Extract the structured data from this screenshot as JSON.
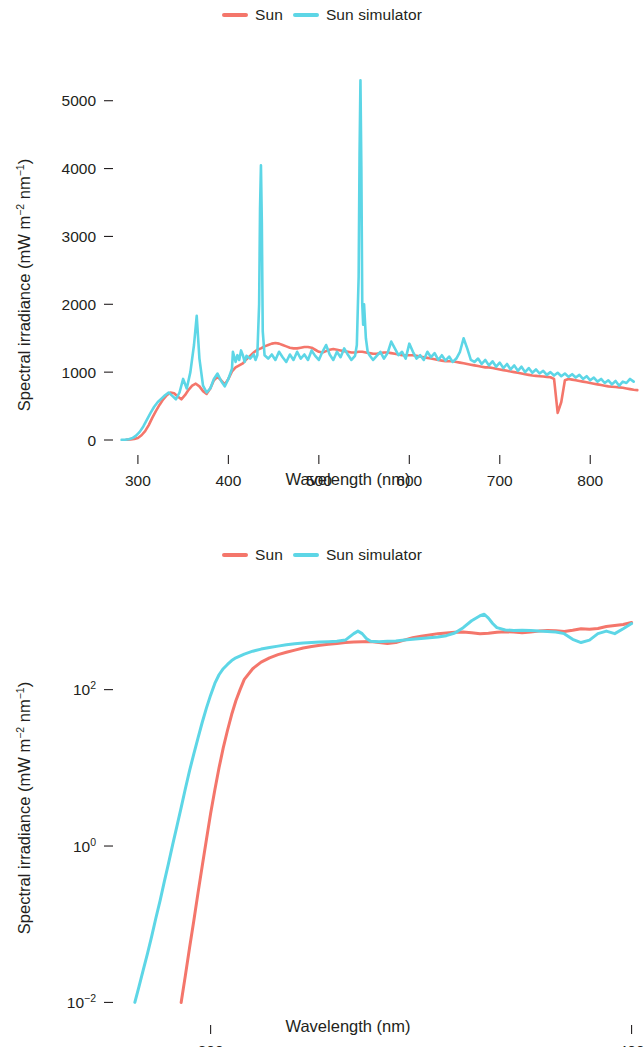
{
  "figures": [
    {
      "id": "linear-spectrum",
      "legend": [
        {
          "label": "Sun",
          "color": "#f4766b",
          "name": "sun"
        },
        {
          "label": "Sun simulator",
          "color": "#5dd6e6",
          "name": "sun-simulator"
        }
      ]
    },
    {
      "id": "log-spectrum",
      "legend": [
        {
          "label": "Sun",
          "color": "#f4766b",
          "name": "sun"
        },
        {
          "label": "Sun simulator",
          "color": "#5dd6e6",
          "name": "sun-simulator"
        }
      ]
    }
  ],
  "chart_data": [
    {
      "type": "line",
      "id": "linear-spectrum",
      "title": "",
      "xlabel": "Wavelength (nm)",
      "ylabel": "Spectral irradiance (mW m⁻² nm⁻¹)",
      "ylabel_parts": {
        "pre": "Spectral irradiance  (mW m",
        "sup1": "−2",
        "mid": " nm",
        "sup2": "−1",
        "post": ")"
      },
      "xlim": [
        278,
        855
      ],
      "ylim": [
        0,
        5600
      ],
      "yscale": "linear",
      "xticks": [
        300,
        400,
        500,
        600,
        700,
        800
      ],
      "xtick_labels": [
        "300",
        "400",
        "500",
        "600",
        "700",
        "800"
      ],
      "yticks": [
        0,
        1000,
        2000,
        3000,
        4000,
        5000
      ],
      "ytick_labels": [
        "0",
        "1000",
        "2000",
        "3000",
        "4000",
        "5000"
      ],
      "grid": false,
      "legend_position": "top-center",
      "annotations": [
        {
          "text": "Hg emission line",
          "x": 436,
          "y": 4050,
          "series": "Sun simulator"
        },
        {
          "text": "Hg emission line",
          "x": 546,
          "y": 5300,
          "series": "Sun simulator"
        },
        {
          "text": "O2 A-band absorption",
          "x": 760,
          "y": 400,
          "series": "Sun"
        }
      ],
      "series": [
        {
          "name": "Sun",
          "color": "#f4766b",
          "x": [
            288,
            292,
            296,
            300,
            304,
            308,
            312,
            316,
            320,
            324,
            328,
            332,
            336,
            340,
            344,
            348,
            352,
            356,
            360,
            364,
            368,
            372,
            376,
            380,
            384,
            388,
            392,
            396,
            400,
            404,
            408,
            412,
            416,
            420,
            424,
            428,
            432,
            436,
            440,
            444,
            448,
            452,
            456,
            460,
            464,
            468,
            472,
            476,
            480,
            484,
            488,
            492,
            496,
            500,
            504,
            508,
            512,
            516,
            520,
            524,
            528,
            532,
            536,
            540,
            544,
            548,
            552,
            556,
            560,
            564,
            568,
            572,
            576,
            580,
            584,
            588,
            592,
            596,
            600,
            604,
            608,
            612,
            616,
            620,
            624,
            628,
            632,
            636,
            640,
            644,
            648,
            652,
            656,
            660,
            664,
            668,
            672,
            676,
            680,
            684,
            688,
            692,
            696,
            700,
            704,
            708,
            712,
            716,
            720,
            724,
            728,
            732,
            736,
            740,
            744,
            748,
            752,
            756,
            760,
            764,
            768,
            772,
            776,
            780,
            784,
            788,
            792,
            796,
            800,
            804,
            808,
            812,
            816,
            820,
            824,
            828,
            832,
            836,
            840,
            844,
            848,
            852
          ],
          "y": [
            5,
            8,
            14,
            30,
            70,
            130,
            220,
            330,
            430,
            520,
            600,
            660,
            700,
            690,
            640,
            600,
            660,
            740,
            800,
            830,
            790,
            720,
            680,
            760,
            880,
            930,
            880,
            820,
            900,
            1010,
            1070,
            1100,
            1130,
            1190,
            1240,
            1290,
            1330,
            1350,
            1380,
            1400,
            1420,
            1430,
            1420,
            1400,
            1380,
            1360,
            1350,
            1350,
            1360,
            1370,
            1370,
            1360,
            1330,
            1300,
            1290,
            1310,
            1330,
            1340,
            1330,
            1320,
            1310,
            1300,
            1290,
            1290,
            1300,
            1300,
            1290,
            1280,
            1270,
            1270,
            1280,
            1290,
            1290,
            1280,
            1270,
            1260,
            1250,
            1250,
            1250,
            1250,
            1240,
            1230,
            1220,
            1210,
            1200,
            1190,
            1180,
            1170,
            1160,
            1160,
            1160,
            1150,
            1140,
            1130,
            1120,
            1110,
            1100,
            1090,
            1080,
            1070,
            1070,
            1060,
            1050,
            1040,
            1030,
            1020,
            1010,
            1000,
            990,
            980,
            970,
            960,
            950,
            945,
            940,
            935,
            930,
            925,
            900,
            400,
            560,
            880,
            900,
            890,
            880,
            870,
            860,
            850,
            840,
            830,
            820,
            810,
            800,
            790,
            785,
            780,
            775,
            770,
            760,
            750,
            740,
            735,
            730,
            725
          ]
        },
        {
          "name": "Sun simulator",
          "color": "#5dd6e6",
          "x": [
            282,
            286,
            290,
            294,
            298,
            302,
            306,
            310,
            314,
            318,
            322,
            326,
            330,
            334,
            338,
            342,
            346,
            350,
            354,
            358,
            362,
            365,
            368,
            372,
            376,
            380,
            384,
            388,
            392,
            396,
            400,
            404,
            405,
            408,
            410,
            412,
            414,
            416,
            418,
            420,
            424,
            428,
            430,
            432,
            434,
            435,
            436,
            437,
            438,
            440,
            444,
            448,
            452,
            456,
            460,
            464,
            468,
            472,
            476,
            480,
            484,
            488,
            492,
            496,
            500,
            504,
            508,
            512,
            516,
            520,
            524,
            528,
            532,
            536,
            540,
            542,
            544,
            545,
            546,
            547,
            548,
            549,
            550,
            552,
            554,
            556,
            560,
            564,
            568,
            572,
            576,
            580,
            584,
            588,
            592,
            596,
            600,
            604,
            608,
            612,
            616,
            620,
            624,
            628,
            632,
            636,
            640,
            644,
            648,
            652,
            656,
            660,
            664,
            668,
            672,
            676,
            680,
            684,
            688,
            692,
            696,
            700,
            704,
            708,
            712,
            716,
            720,
            724,
            728,
            732,
            736,
            740,
            744,
            748,
            752,
            756,
            760,
            764,
            768,
            772,
            776,
            780,
            784,
            788,
            792,
            796,
            800,
            804,
            808,
            812,
            816,
            820,
            824,
            828,
            832,
            836,
            840,
            844,
            848,
            852
          ],
          "y": [
            3,
            6,
            12,
            28,
            65,
            120,
            200,
            300,
            400,
            490,
            560,
            610,
            660,
            700,
            650,
            600,
            700,
            900,
            760,
            1000,
            1400,
            1830,
            1200,
            800,
            700,
            760,
            900,
            980,
            870,
            790,
            900,
            1050,
            1300,
            1150,
            1250,
            1180,
            1320,
            1250,
            1150,
            1240,
            1200,
            1260,
            1180,
            1250,
            2000,
            3400,
            4050,
            3200,
            1600,
            1250,
            1200,
            1260,
            1180,
            1300,
            1220,
            1150,
            1260,
            1180,
            1300,
            1200,
            1260,
            1180,
            1320,
            1240,
            1180,
            1300,
            1400,
            1260,
            1180,
            1300,
            1220,
            1350,
            1260,
            1180,
            1240,
            1400,
            2400,
            4200,
            5300,
            4000,
            2000,
            1700,
            2000,
            1500,
            1300,
            1250,
            1180,
            1240,
            1300,
            1200,
            1280,
            1450,
            1350,
            1250,
            1300,
            1200,
            1420,
            1300,
            1200,
            1250,
            1180,
            1300,
            1220,
            1280,
            1180,
            1250,
            1170,
            1230,
            1150,
            1200,
            1300,
            1500,
            1350,
            1180,
            1150,
            1200,
            1120,
            1180,
            1100,
            1160,
            1080,
            1140,
            1060,
            1120,
            1040,
            1100,
            1020,
            1080,
            1000,
            1060,
            990,
            1040,
            980,
            1020,
            960,
            1000,
            950,
            990,
            940,
            980,
            930,
            970,
            920,
            960,
            900,
            940,
            880,
            920,
            860,
            900,
            840,
            880,
            820,
            870,
            800,
            860,
            840,
            900,
            860
          ]
        }
      ]
    },
    {
      "type": "line",
      "id": "log-spectrum",
      "title": "",
      "xlabel": "Wavelength (nm)",
      "ylabel": "Spectral irradiance (mW m⁻² nm⁻¹)",
      "ylabel_parts": {
        "pre": "Spectral irradiance  (mW m",
        "sup1": "−2",
        "mid": " nm",
        "sup2": "−1",
        "post": ")"
      },
      "xlim": [
        278,
        402
      ],
      "ylim": [
        0.008,
        1400
      ],
      "yscale": "log",
      "xticks": [
        300,
        400
      ],
      "xtick_labels": [
        "300",
        "400"
      ],
      "yticks": [
        0.01,
        1,
        100
      ],
      "ytick_labels": [
        "10⁻²",
        "10⁰",
        "10²"
      ],
      "ytick_label_parts": [
        {
          "base": "10",
          "exp": "−2"
        },
        {
          "base": "10",
          "exp": "0"
        },
        {
          "base": "10",
          "exp": "2"
        }
      ],
      "grid": false,
      "legend_position": "top-center",
      "series": [
        {
          "name": "Sun",
          "color": "#f4766b",
          "x": [
            293,
            294,
            295,
            296,
            297,
            298,
            299,
            300,
            301,
            302,
            303,
            304,
            305,
            306,
            307,
            308,
            310,
            312,
            314,
            316,
            318,
            320,
            322,
            324,
            326,
            328,
            330,
            332,
            334,
            336,
            338,
            340,
            342,
            344,
            346,
            348,
            350,
            352,
            354,
            356,
            358,
            360,
            362,
            364,
            366,
            368,
            370,
            372,
            374,
            376,
            378,
            380,
            382,
            384,
            386,
            388,
            390,
            392,
            394,
            396,
            398,
            400
          ],
          "y": [
            0.01,
            0.022,
            0.05,
            0.11,
            0.25,
            0.55,
            1.2,
            2.6,
            5.2,
            10,
            18,
            30,
            48,
            72,
            100,
            135,
            185,
            225,
            255,
            280,
            300,
            320,
            340,
            355,
            370,
            380,
            390,
            400,
            405,
            410,
            412,
            400,
            390,
            400,
            430,
            460,
            480,
            500,
            520,
            530,
            540,
            545,
            535,
            520,
            525,
            540,
            550,
            545,
            535,
            545,
            560,
            570,
            565,
            555,
            575,
            600,
            590,
            605,
            640,
            660,
            680,
            720
          ]
        },
        {
          "name": "Sun simulator",
          "color": "#5dd6e6",
          "x": [
            282,
            283,
            284,
            285,
            286,
            287,
            288,
            289,
            290,
            291,
            292,
            293,
            294,
            295,
            296,
            297,
            298,
            299,
            300,
            301,
            302,
            303,
            304,
            305,
            306,
            308,
            310,
            312,
            314,
            316,
            318,
            320,
            322,
            324,
            326,
            328,
            330,
            332,
            334,
            335,
            336,
            337,
            338,
            340,
            342,
            344,
            346,
            348,
            350,
            352,
            354,
            356,
            358,
            360,
            362,
            364,
            365,
            366,
            367,
            368,
            370,
            372,
            374,
            376,
            378,
            380,
            382,
            384,
            386,
            388,
            390,
            392,
            394,
            396,
            398,
            400
          ],
          "y": [
            0.01,
            0.016,
            0.026,
            0.042,
            0.07,
            0.12,
            0.2,
            0.35,
            0.6,
            1.05,
            1.8,
            3.1,
            5.4,
            9.2,
            15,
            24,
            38,
            58,
            85,
            120,
            155,
            185,
            210,
            235,
            255,
            285,
            310,
            330,
            345,
            360,
            375,
            385,
            395,
            400,
            405,
            410,
            415,
            430,
            520,
            560,
            520,
            450,
            415,
            410,
            415,
            420,
            430,
            440,
            450,
            460,
            470,
            490,
            530,
            620,
            760,
            880,
            920,
            820,
            700,
            620,
            580,
            570,
            575,
            570,
            560,
            555,
            545,
            520,
            440,
            400,
            430,
            520,
            560,
            520,
            600,
            700
          ]
        }
      ]
    }
  ]
}
